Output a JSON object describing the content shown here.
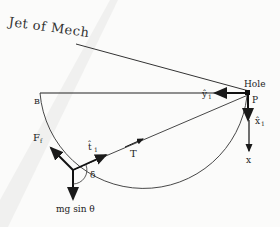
{
  "header": {
    "text": "Jet of Mech"
  },
  "labels": {
    "hole": "Hole",
    "p": "P",
    "b": "B",
    "y1": "ŷ",
    "y1_sub": "1",
    "x1": "x̂",
    "x1_sub": "1",
    "x": "x",
    "t1": "t̂",
    "t1_sub": "1",
    "T": "T",
    "Ff": "F",
    "Ff_sub": "f",
    "delta": "δ",
    "mg": "mg sin θ"
  },
  "colors": {
    "ink": "#1a1a1a",
    "paper": "#fbfbfa",
    "shadow": "#e8e8e6"
  }
}
